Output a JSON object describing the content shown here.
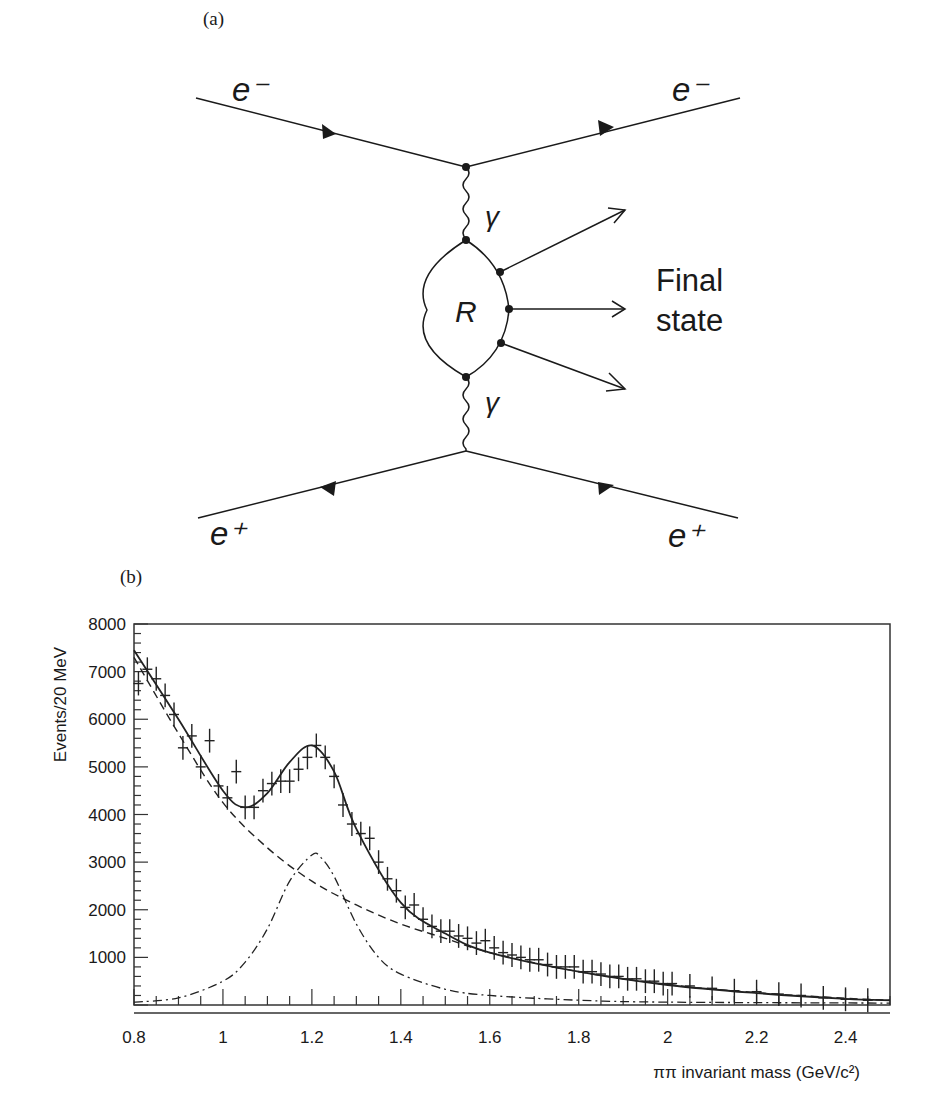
{
  "figure": {
    "panel_a_label": "(a)",
    "panel_b_label": "(b)"
  },
  "diagram": {
    "incoming_electron": "e⁻",
    "outgoing_electron": "e⁻",
    "incoming_positron": "e⁺",
    "outgoing_positron": "e⁺",
    "photon_upper": "γ",
    "photon_lower": "γ",
    "resonance": "R",
    "final_state_line1": "Final",
    "final_state_line2": "state"
  },
  "chart_data": {
    "type": "scatter",
    "title": "",
    "xlabel": "ππ invariant mass (GeV/c²)",
    "ylabel": "Events/20 MeV",
    "xlim": [
      0.8,
      2.5
    ],
    "ylim": [
      0,
      8000
    ],
    "xticks": [
      0.8,
      1,
      1.2,
      1.4,
      1.6,
      1.8,
      2,
      2.2,
      2.4
    ],
    "xtick_labels": [
      "0.8",
      "1",
      "1.2",
      "1.4",
      "1.6",
      "1.8",
      "2",
      "2.2",
      "2.4"
    ],
    "yticks": [
      1000,
      2000,
      3000,
      4000,
      5000,
      6000,
      7000,
      8000
    ],
    "ytick_labels": [
      "1000",
      "2000",
      "3000",
      "4000",
      "5000",
      "6000",
      "7000",
      "8000"
    ],
    "grid": false,
    "legend": null,
    "series": [
      {
        "name": "data",
        "style": "points with error bars",
        "x": [
          0.81,
          0.83,
          0.85,
          0.87,
          0.89,
          0.91,
          0.93,
          0.95,
          0.97,
          0.99,
          1.01,
          1.03,
          1.05,
          1.07,
          1.09,
          1.11,
          1.13,
          1.15,
          1.17,
          1.19,
          1.21,
          1.23,
          1.25,
          1.27,
          1.29,
          1.31,
          1.33,
          1.35,
          1.37,
          1.39,
          1.41,
          1.43,
          1.45,
          1.47,
          1.49,
          1.51,
          1.53,
          1.55,
          1.57,
          1.59,
          1.61,
          1.63,
          1.65,
          1.67,
          1.69,
          1.71,
          1.73,
          1.75,
          1.77,
          1.79,
          1.81,
          1.83,
          1.85,
          1.87,
          1.89,
          1.91,
          1.93,
          1.95,
          1.97,
          1.99,
          2.01,
          2.05,
          2.1,
          2.15,
          2.2,
          2.25,
          2.3,
          2.35,
          2.4,
          2.45
        ],
        "y": [
          6750,
          7050,
          6850,
          6500,
          6100,
          5400,
          5650,
          5000,
          5550,
          4600,
          4350,
          4900,
          4150,
          4150,
          4500,
          4650,
          4700,
          4700,
          4950,
          5200,
          5450,
          5200,
          4800,
          4200,
          3800,
          3600,
          3500,
          3000,
          2650,
          2400,
          2050,
          2100,
          1800,
          1650,
          1550,
          1550,
          1450,
          1400,
          1300,
          1350,
          1200,
          1100,
          1050,
          1000,
          950,
          950,
          850,
          800,
          800,
          800,
          700,
          700,
          650,
          600,
          600,
          550,
          550,
          500,
          500,
          450,
          450,
          400,
          350,
          300,
          280,
          230,
          200,
          150,
          120,
          100
        ],
        "yerr": 250
      },
      {
        "name": "total fit",
        "style": "solid line",
        "x": [
          0.8,
          0.9,
          1.0,
          1.05,
          1.1,
          1.15,
          1.2,
          1.25,
          1.3,
          1.4,
          1.5,
          1.6,
          1.8,
          2.0,
          2.2,
          2.4,
          2.5
        ],
        "y": [
          7450,
          6000,
          4500,
          4150,
          4450,
          5100,
          5450,
          4900,
          3700,
          2150,
          1500,
          1100,
          700,
          420,
          250,
          130,
          100
        ]
      },
      {
        "name": "background",
        "style": "dashed line",
        "x": [
          0.8,
          0.9,
          1.0,
          1.1,
          1.2,
          1.3,
          1.4,
          1.5,
          1.6,
          1.8,
          2.0,
          2.2,
          2.4,
          2.5
        ],
        "y": [
          7300,
          5700,
          4250,
          3300,
          2600,
          2100,
          1700,
          1400,
          1100,
          700,
          430,
          260,
          140,
          100
        ]
      },
      {
        "name": "resonance signal",
        "style": "dash-dot line",
        "x": [
          0.8,
          0.9,
          1.0,
          1.05,
          1.1,
          1.15,
          1.2,
          1.22,
          1.25,
          1.3,
          1.35,
          1.4,
          1.5,
          1.6,
          1.8,
          2.0,
          2.5
        ],
        "y": [
          60,
          150,
          500,
          900,
          1600,
          2600,
          3150,
          3100,
          2700,
          1700,
          1000,
          650,
          330,
          200,
          100,
          60,
          40
        ]
      }
    ]
  }
}
